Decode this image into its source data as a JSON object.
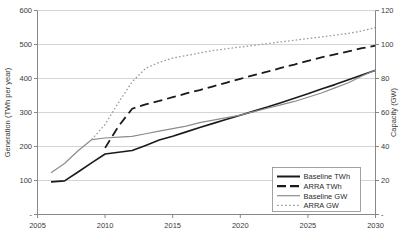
{
  "chart_data": {
    "type": "line",
    "title": "",
    "xlabel": "",
    "ylabel": "Generation (TWh per year)",
    "y2label": "Capacity (GW)",
    "xlim": [
      2005,
      2030
    ],
    "ylim": [
      0,
      600
    ],
    "y2lim": [
      0,
      120
    ],
    "grid": true,
    "legend_position": "bottom-right",
    "x_ticks": [
      "2005",
      "2010",
      "2015",
      "2020",
      "2025",
      "2030"
    ],
    "y_ticks": [
      "-",
      "100",
      "200",
      "300",
      "400",
      "500",
      "600"
    ],
    "y2_ticks": [
      "-",
      "20",
      "40",
      "60",
      "80",
      "100",
      "120"
    ],
    "series": [
      {
        "name": "Baseline TWh",
        "axis": "left",
        "style": "solid",
        "color": "#1a1a1a",
        "width": 1.6,
        "x": [
          2006,
          2007,
          2008,
          2009,
          2010,
          2011,
          2012,
          2013,
          2014,
          2015,
          2016,
          2017,
          2018,
          2019,
          2020,
          2021,
          2022,
          2023,
          2024,
          2025,
          2026,
          2027,
          2028,
          2029,
          2030
        ],
        "values": [
          96,
          99,
          125,
          152,
          178,
          183,
          188,
          203,
          219,
          230,
          243,
          256,
          268,
          280,
          292,
          304,
          316,
          329,
          342,
          355,
          369,
          382,
          396,
          410,
          424
        ]
      },
      {
        "name": "ARRA TWh",
        "axis": "left",
        "style": "dashed",
        "color": "#1a1a1a",
        "width": 1.8,
        "x": [
          2010,
          2011,
          2012,
          2013,
          2014,
          2015,
          2016,
          2017,
          2018,
          2019,
          2020,
          2021,
          2022,
          2023,
          2024,
          2025,
          2026,
          2027,
          2028,
          2029,
          2030
        ],
        "values": [
          196,
          260,
          311,
          324,
          334,
          345,
          356,
          366,
          377,
          388,
          399,
          410,
          420,
          431,
          441,
          452,
          462,
          471,
          480,
          489,
          497
        ]
      },
      {
        "name": "Baseline GW",
        "axis": "right",
        "style": "solid",
        "color": "#8c8c8c",
        "width": 1.2,
        "x": [
          2006,
          2007,
          2008,
          2009,
          2010,
          2011,
          2012,
          2013,
          2014,
          2015,
          2016,
          2017,
          2018,
          2019,
          2020,
          2021,
          2022,
          2023,
          2024,
          2025,
          2026,
          2027,
          2028,
          2029,
          2030
        ],
        "values": [
          24.5,
          30,
          37.5,
          44,
          45,
          45.5,
          46,
          47.5,
          49,
          50.5,
          52,
          54,
          55.5,
          57,
          58.5,
          60.5,
          62.5,
          64.5,
          66.5,
          69,
          71.5,
          74.5,
          77.5,
          81.5,
          85
        ]
      },
      {
        "name": "ARRA GW",
        "axis": "right",
        "style": "dotted",
        "color": "#9a9a9a",
        "width": 1.3,
        "x": [
          2009,
          2010,
          2011,
          2012,
          2013,
          2014,
          2015,
          2016,
          2017,
          2018,
          2019,
          2020,
          2021,
          2022,
          2023,
          2024,
          2025,
          2026,
          2027,
          2028,
          2029,
          2030
        ],
        "values": [
          44,
          53,
          66,
          78,
          86,
          89.5,
          92,
          93.5,
          95,
          96.5,
          97.5,
          98.5,
          99.5,
          100.5,
          101.5,
          102.5,
          103.5,
          104.5,
          105.5,
          106.5,
          108,
          110
        ]
      }
    ],
    "legend": [
      {
        "label": "Baseline TWh",
        "style": "solid",
        "color": "#1a1a1a",
        "width": 2
      },
      {
        "label": "ARRA TWh",
        "style": "dashed",
        "color": "#1a1a1a",
        "width": 2.2
      },
      {
        "label": "Baseline GW",
        "style": "solid",
        "color": "#8c8c8c",
        "width": 1.2
      },
      {
        "label": "ARRA GW",
        "style": "dotted",
        "color": "#9a9a9a",
        "width": 1.3
      }
    ]
  },
  "colors": {
    "axis": "#7a7a7a",
    "grid": "#c9c9c9",
    "text": "#3a3a3a",
    "background": "#ffffff"
  }
}
